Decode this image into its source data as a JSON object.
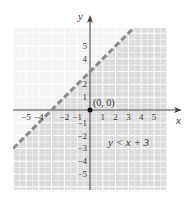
{
  "chart_data": {
    "type": "line",
    "title": "",
    "xlabel": "x",
    "ylabel": "y",
    "xlim": [
      -6,
      6
    ],
    "ylim": [
      -6,
      6
    ],
    "grid": true,
    "grid_minor": true,
    "x_ticks": [
      -5,
      -4,
      -2,
      -1,
      1,
      2,
      3,
      4,
      5
    ],
    "x_tick_labels": [
      "−5",
      "−4",
      "−2",
      "−1",
      "1",
      "2",
      "3",
      "4",
      "5"
    ],
    "y_ticks": [
      5,
      4,
      2,
      1,
      -1,
      -2,
      -3,
      -4,
      -5
    ],
    "y_tick_labels": [
      "5",
      "4",
      "2",
      "1",
      "−1",
      "−2",
      "−3",
      "−4",
      "−5"
    ],
    "boundary_line": {
      "equation": "y = x + 3",
      "slope": 1,
      "intercept": 3,
      "style": "dashed",
      "color": "#8a8a8a"
    },
    "shaded_region": {
      "inequality": "y < x + 3",
      "side": "below",
      "color": "#d9d9d9"
    },
    "test_point": {
      "x": 0,
      "y": 0,
      "label": "(0, 0)"
    },
    "annotation": "y < x + 3"
  },
  "colors": {
    "unshaded": "#f4f4f4",
    "shaded": "#dcdcdc",
    "grid": "#ffffff",
    "axis": "#444444",
    "dash": "#8a8a8a"
  }
}
